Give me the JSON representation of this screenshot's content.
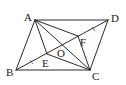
{
  "figure": {
    "type": "geometry-diagram",
    "shape": "parallelogram ABCD",
    "points": {
      "A": {
        "label": "A",
        "x": 35,
        "y": 20,
        "lx": 24,
        "ly": 21
      },
      "D": {
        "label": "D",
        "x": 108,
        "y": 20,
        "lx": 111,
        "ly": 22
      },
      "B": {
        "label": "B",
        "x": 16,
        "y": 70,
        "lx": 6,
        "ly": 76
      },
      "C": {
        "label": "C",
        "x": 90,
        "y": 70,
        "lx": 92,
        "ly": 80
      },
      "O": {
        "label": "O",
        "x": 62,
        "y": 45,
        "lx": 57,
        "ly": 57
      },
      "E": {
        "label": "E",
        "x": 47,
        "y": 54,
        "lx": 42,
        "ly": 67
      },
      "F": {
        "label": "F",
        "x": 78,
        "y": 36,
        "lx": 80,
        "ly": 46
      }
    },
    "segments": [
      [
        "A",
        "D"
      ],
      [
        "D",
        "C"
      ],
      [
        "C",
        "B"
      ],
      [
        "B",
        "A"
      ],
      [
        "A",
        "C"
      ],
      [
        "B",
        "D"
      ],
      [
        "A",
        "E"
      ],
      [
        "A",
        "F"
      ],
      [
        "C",
        "E"
      ],
      [
        "C",
        "F"
      ]
    ],
    "equal_marks": [
      "BE",
      "FD"
    ],
    "labels": {
      "A": "A",
      "B": "B",
      "C": "C",
      "D": "D",
      "E": "E",
      "F": "F",
      "O": "O"
    }
  }
}
